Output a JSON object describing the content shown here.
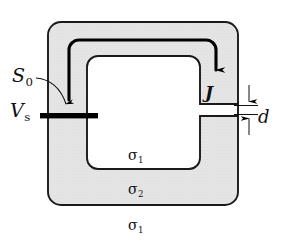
{
  "figure": {
    "type": "physics-schematic",
    "canvas": {
      "width": 285,
      "height": 248
    },
    "colors": {
      "conductor_fill": "#e4e4e4",
      "hole_fill": "#ffffff",
      "background": "#ffffff",
      "outline": "#1a1a1a",
      "current_path": "#000000",
      "electrode": "#000000"
    },
    "labels": {
      "surface": {
        "symbol": "S",
        "subscript": "0",
        "text": "S0"
      },
      "source_voltage": {
        "symbol": "V",
        "subscript": "s",
        "text": "Vs"
      },
      "current_density": {
        "symbol": "J",
        "text": "J"
      },
      "gap_width": {
        "symbol": "d",
        "text": "d"
      },
      "conductivity_inner": {
        "symbol": "σ",
        "subscript": "1",
        "text": "σ1"
      },
      "conductivity_body": {
        "symbol": "σ",
        "subscript": "2",
        "text": "σ2"
      },
      "conductivity_outer": {
        "symbol": "σ",
        "subscript": "1",
        "text": "σ1"
      }
    },
    "elements": {
      "conductor_ring": "rounded-square-ring",
      "gap": "right-side-slot",
      "electrode_bar": "horizontal-black-bar-on-left-wall",
      "current_arrow": "path-up-over-top-down-right-arm",
      "leader_line": "curved-arrow-from-S0-to-electrode",
      "dimension_arrows": "vertical-pair-marking-gap-d"
    }
  }
}
